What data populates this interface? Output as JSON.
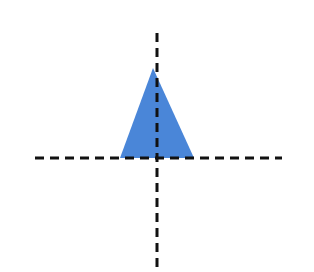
{
  "diagram": {
    "background": "#ffffff",
    "shape": {
      "type": "triangle",
      "fill": "#4a86d8",
      "points": [
        [
          153,
          68
        ],
        [
          120,
          158
        ],
        [
          194,
          158
        ]
      ]
    },
    "axes": {
      "color": "#111111",
      "stroke_width": 3,
      "dash": "9 6",
      "horizontal": {
        "x1": 35,
        "y1": 158,
        "x2": 282,
        "y2": 158
      },
      "vertical": {
        "x1": 157,
        "y1": 33,
        "x2": 157,
        "y2": 270
      }
    }
  }
}
